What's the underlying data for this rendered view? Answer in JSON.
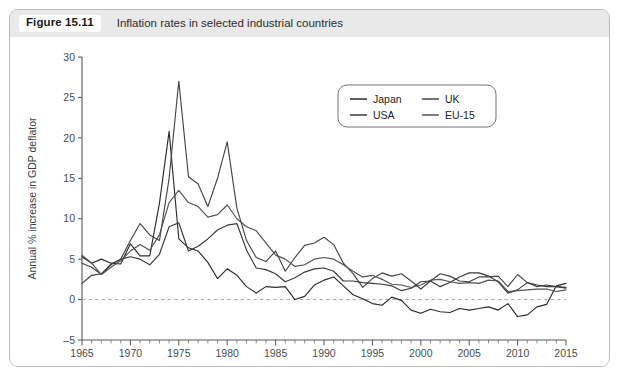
{
  "figure": {
    "number_label": "Figure 15.11",
    "title": "Inflation rates in selected industrial countries",
    "footnote": ""
  },
  "colors": {
    "panel_border": "#b9b9b9",
    "caption_background": "#e9e9e9",
    "axis": "#55595c",
    "zero_line": "#9aa0a4",
    "japan": "#2b2b2b",
    "uk": "#444444",
    "usa": "#3a3a3a",
    "eu15": "#525252"
  },
  "chart_data": {
    "type": "line",
    "title": "Inflation rates in selected industrial countries",
    "xlabel": "",
    "ylabel": "Annual % increase in GDP deflator",
    "xlim": [
      1965,
      2015
    ],
    "ylim": [
      -5,
      30
    ],
    "y_ticks": [
      -5,
      0,
      5,
      10,
      15,
      20,
      25,
      30
    ],
    "x_ticks": [
      1965,
      1970,
      1975,
      1980,
      1985,
      1990,
      1995,
      2000,
      2005,
      2010,
      2015
    ],
    "x_minor_tick_step": 1,
    "grid": false,
    "zero_reference_line": true,
    "legend_position": "upper-center-right",
    "legend_entries": [
      "Japan",
      "UK",
      "USA",
      "EU-15"
    ],
    "x": [
      1965,
      1966,
      1967,
      1968,
      1969,
      1970,
      1971,
      1972,
      1973,
      1974,
      1975,
      1976,
      1977,
      1978,
      1979,
      1980,
      1981,
      1982,
      1983,
      1984,
      1985,
      1986,
      1987,
      1988,
      1989,
      1990,
      1991,
      1992,
      1993,
      1994,
      1995,
      1996,
      1997,
      1998,
      1999,
      2000,
      2001,
      2002,
      2003,
      2004,
      2005,
      2006,
      2007,
      2008,
      2009,
      2010,
      2011,
      2012,
      2013,
      2014,
      2015
    ],
    "series": [
      {
        "name": "Japan",
        "values": [
          5.3,
          4.5,
          5.0,
          4.5,
          4.4,
          6.9,
          5.4,
          5.4,
          11.9,
          20.8,
          7.5,
          6.4,
          6.0,
          4.6,
          2.6,
          3.8,
          3.0,
          1.6,
          0.8,
          1.6,
          1.5,
          1.6,
          0.0,
          0.4,
          1.8,
          2.4,
          2.8,
          1.7,
          0.6,
          0.1,
          -0.5,
          -0.7,
          0.3,
          -0.1,
          -1.3,
          -1.7,
          -1.2,
          -1.5,
          -1.6,
          -1.1,
          -1.3,
          -1.1,
          -0.9,
          -1.3,
          -0.5,
          -2.1,
          -1.9,
          -0.9,
          -0.6,
          1.7,
          2.0
        ]
      },
      {
        "name": "UK",
        "values": [
          4.5,
          4.0,
          3.1,
          4.4,
          5.0,
          7.3,
          9.4,
          8.0,
          7.3,
          15.0,
          27.0,
          15.2,
          14.3,
          11.5,
          15.0,
          19.5,
          11.3,
          7.3,
          5.2,
          4.7,
          6.0,
          3.5,
          5.2,
          6.7,
          7.0,
          7.7,
          6.8,
          4.5,
          3.2,
          1.5,
          2.6,
          3.3,
          2.9,
          3.2,
          2.3,
          1.3,
          2.3,
          3.2,
          2.9,
          2.3,
          2.2,
          2.8,
          2.8,
          2.9,
          1.6,
          3.1,
          2.1,
          1.6,
          1.8,
          1.6,
          1.4
        ]
      },
      {
        "name": "USA",
        "values": [
          2.0,
          3.0,
          3.2,
          4.3,
          5.0,
          5.3,
          5.0,
          4.3,
          5.6,
          9.0,
          9.5,
          6.0,
          6.6,
          7.5,
          8.6,
          9.2,
          9.4,
          6.1,
          3.9,
          3.7,
          3.2,
          2.2,
          2.7,
          3.4,
          3.8,
          3.9,
          3.5,
          2.3,
          2.3,
          2.1,
          2.0,
          1.9,
          1.7,
          1.1,
          1.4,
          2.2,
          2.3,
          1.6,
          2.1,
          2.8,
          3.3,
          3.3,
          2.9,
          2.2,
          0.8,
          1.2,
          2.1,
          1.8,
          1.6,
          1.6,
          1.5
        ]
      },
      {
        "name": "EU-15",
        "values": [
          5.5,
          4.5,
          3.1,
          4.0,
          4.8,
          6.0,
          6.8,
          6.1,
          8.0,
          12.0,
          13.5,
          12.0,
          11.5,
          10.2,
          10.5,
          11.7,
          10.0,
          9.0,
          8.5,
          7.0,
          5.5,
          5.0,
          4.1,
          4.3,
          5.0,
          5.2,
          5.0,
          4.3,
          3.5,
          2.8,
          3.0,
          2.5,
          1.9,
          1.8,
          1.5,
          1.8,
          2.4,
          2.5,
          2.2,
          2.0,
          2.1,
          2.0,
          2.4,
          2.3,
          1.0,
          1.1,
          1.2,
          1.3,
          1.3,
          1.0,
          1.2
        ]
      }
    ]
  }
}
